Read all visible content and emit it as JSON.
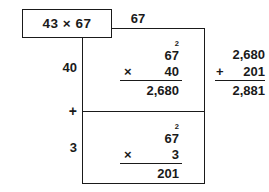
{
  "problem": {
    "expression": "43 × 67"
  },
  "grid": {
    "top_label": "67",
    "left_labels": {
      "tens": "40",
      "operator": "+",
      "ones": "3"
    }
  },
  "partial_products": [
    {
      "name": "tens-partial-product",
      "carry": "2",
      "multiplicand": "67",
      "operator": "×",
      "multiplier": "40",
      "product": "2,680"
    },
    {
      "name": "ones-partial-product",
      "carry": "2",
      "multiplicand": "67",
      "operator": "×",
      "multiplier": "3",
      "product": "201"
    }
  ],
  "final_sum": {
    "addend_one": "2,680",
    "operator": "+",
    "addend_two": "201",
    "total": "2,881"
  },
  "colors": {
    "ink": "#1a1a1a",
    "background": "#ffffff"
  }
}
